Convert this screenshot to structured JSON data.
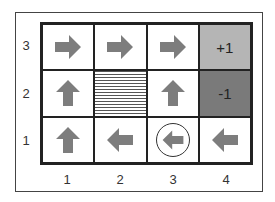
{
  "grid": {
    "rows": 3,
    "cols": 4,
    "row_labels": [
      "3",
      "2",
      "1"
    ],
    "col_labels": [
      "1",
      "2",
      "3",
      "4"
    ],
    "cells": [
      {
        "row": 3,
        "col": 1,
        "type": "arrow",
        "direction": "right"
      },
      {
        "row": 3,
        "col": 2,
        "type": "arrow",
        "direction": "right"
      },
      {
        "row": 3,
        "col": 3,
        "type": "arrow",
        "direction": "right"
      },
      {
        "row": 3,
        "col": 4,
        "type": "terminal",
        "label": "+1",
        "color": "#b5b5b5"
      },
      {
        "row": 2,
        "col": 1,
        "type": "arrow",
        "direction": "up"
      },
      {
        "row": 2,
        "col": 2,
        "type": "wall"
      },
      {
        "row": 2,
        "col": 3,
        "type": "arrow",
        "direction": "up"
      },
      {
        "row": 2,
        "col": 4,
        "type": "terminal",
        "label": "-1",
        "color": "#7a7a7a"
      },
      {
        "row": 1,
        "col": 1,
        "type": "arrow",
        "direction": "up"
      },
      {
        "row": 1,
        "col": 2,
        "type": "arrow",
        "direction": "left"
      },
      {
        "row": 1,
        "col": 3,
        "type": "arrow",
        "direction": "left",
        "circled": true
      },
      {
        "row": 1,
        "col": 4,
        "type": "arrow",
        "direction": "left"
      }
    ]
  },
  "colors": {
    "arrow": "#7d7d7d",
    "border": "#222222"
  }
}
